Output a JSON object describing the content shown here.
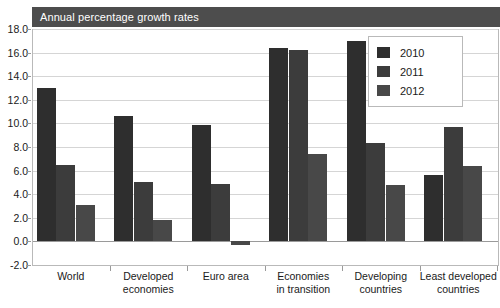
{
  "title": "Annual percentage growth rates",
  "chart_data": {
    "type": "bar",
    "title": "Annual percentage growth rates",
    "xlabel": "",
    "ylabel": "",
    "ylim": [
      -2.0,
      18.0
    ],
    "ytick_labels": [
      "18.0",
      "16.0",
      "14.0",
      "12.0",
      "10.0",
      "8.0",
      "6.0",
      "4.0",
      "2.0",
      "0.0",
      "-2.0"
    ],
    "ytick_values": [
      18.0,
      16.0,
      14.0,
      12.0,
      10.0,
      8.0,
      6.0,
      4.0,
      2.0,
      0.0,
      -2.0
    ],
    "grid": true,
    "legend_position": "top-right",
    "categories": [
      "World",
      "Developed economies",
      "Euro area",
      "Economies in transition",
      "Developing countries",
      "Least developed countries"
    ],
    "category_lines": [
      [
        "World"
      ],
      [
        "Developed",
        "economies"
      ],
      [
        "Euro area"
      ],
      [
        "Economies",
        "in transition"
      ],
      [
        "Developing",
        "countries"
      ],
      [
        "Least developed",
        "countries"
      ]
    ],
    "series": [
      {
        "name": "2010",
        "color": "#2e2e2e",
        "values": [
          13.0,
          10.6,
          9.9,
          16.4,
          17.0,
          5.6
        ]
      },
      {
        "name": "2011",
        "color": "#3c3c3c",
        "values": [
          6.5,
          5.0,
          4.9,
          16.2,
          8.3,
          9.7
        ]
      },
      {
        "name": "2012",
        "color": "#484848",
        "values": [
          3.1,
          1.8,
          -0.3,
          7.4,
          4.8,
          6.4
        ]
      }
    ]
  },
  "legend": {
    "items": [
      {
        "label": "2010",
        "color": "#2e2e2e"
      },
      {
        "label": "2011",
        "color": "#3c3c3c"
      },
      {
        "label": "2012",
        "color": "#484848"
      }
    ]
  }
}
